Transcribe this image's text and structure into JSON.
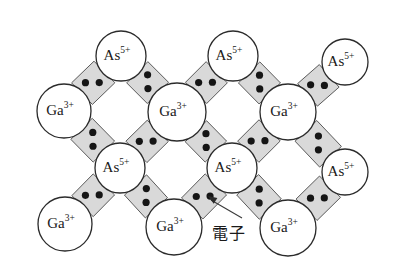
{
  "figure": {
    "background_color": "#ffffff",
    "width": 394,
    "height": 271
  },
  "legend": {
    "electron_label": "電子",
    "electron_label_meaning": "electron",
    "callout_text_x": 212,
    "callout_text_y": 220,
    "arrow_from": [
      242,
      218
    ],
    "arrow_to": [
      208,
      196
    ]
  },
  "species": {
    "gallium": {
      "base": "Ga",
      "superscript": "3+",
      "radius": 27,
      "fill": "#ffffff",
      "stroke": "#2b2b2b"
    },
    "arsenic": {
      "base": "As",
      "superscript": "5+",
      "radius": 24,
      "fill": "#ffffff",
      "stroke": "#2b2b2b"
    }
  },
  "colors": {
    "bond_fill": "#d9d9d9",
    "bond_stroke": "#4a4a4a",
    "electron_dot": "#151515",
    "atom_stroke": "#2b2b2b",
    "text": "#1a1a1a"
  },
  "atoms": [
    {
      "id": "as-r1-c1",
      "type": "arsenic",
      "label_base": "As",
      "label_sup": "5+",
      "cx": 121,
      "cy": 56,
      "r": 25
    },
    {
      "id": "as-r1-c2",
      "type": "arsenic",
      "label_base": "As",
      "label_sup": "5+",
      "cx": 233,
      "cy": 56,
      "r": 25
    },
    {
      "id": "as-r1-c3",
      "type": "arsenic",
      "label_base": "As",
      "label_sup": "5+",
      "cx": 345,
      "cy": 62,
      "r": 23
    },
    {
      "id": "ga-r2-c0",
      "type": "gallium",
      "label_base": "Ga",
      "label_sup": "3+",
      "cx": 64,
      "cy": 111,
      "r": 27
    },
    {
      "id": "ga-r2-c1",
      "type": "gallium",
      "label_base": "Ga",
      "label_sup": "3+",
      "cx": 177,
      "cy": 112,
      "r": 29
    },
    {
      "id": "ga-r2-c2",
      "type": "gallium",
      "label_base": "Ga",
      "label_sup": "3+",
      "cx": 288,
      "cy": 112,
      "r": 28
    },
    {
      "id": "as-r3-c1",
      "type": "arsenic",
      "label_base": "As",
      "label_sup": "5+",
      "cx": 120,
      "cy": 168,
      "r": 25
    },
    {
      "id": "as-r3-c2",
      "type": "arsenic",
      "label_base": "As",
      "label_sup": "5+",
      "cx": 232,
      "cy": 168,
      "r": 25
    },
    {
      "id": "as-r3-c3",
      "type": "arsenic",
      "label_base": "As",
      "label_sup": "5+",
      "cx": 345,
      "cy": 172,
      "r": 23
    },
    {
      "id": "ga-r4-c0",
      "type": "gallium",
      "label_base": "Ga",
      "label_sup": "3+",
      "cx": 65,
      "cy": 224,
      "r": 27
    },
    {
      "id": "ga-r4-c1",
      "type": "gallium",
      "label_base": "Ga",
      "label_sup": "3+",
      "cx": 174,
      "cy": 227,
      "r": 28
    },
    {
      "id": "ga-r4-c2",
      "type": "gallium",
      "label_base": "Ga",
      "label_sup": "3+",
      "cx": 288,
      "cy": 228,
      "r": 28
    }
  ],
  "bonds": [
    {
      "id": "bond-1",
      "from": "ga-r2-c0",
      "to": "as-r1-c1",
      "electrons": 2
    },
    {
      "id": "bond-2",
      "from": "as-r1-c1",
      "to": "ga-r2-c1",
      "electrons": 2
    },
    {
      "id": "bond-3",
      "from": "ga-r2-c1",
      "to": "as-r1-c2",
      "electrons": 2
    },
    {
      "id": "bond-4",
      "from": "as-r1-c2",
      "to": "ga-r2-c2",
      "electrons": 2
    },
    {
      "id": "bond-5",
      "from": "ga-r2-c2",
      "to": "as-r1-c3",
      "electrons": 2
    },
    {
      "id": "bond-6",
      "from": "ga-r2-c0",
      "to": "as-r3-c1",
      "electrons": 2
    },
    {
      "id": "bond-7",
      "from": "as-r3-c1",
      "to": "ga-r2-c1",
      "electrons": 2
    },
    {
      "id": "bond-8",
      "from": "ga-r2-c1",
      "to": "as-r3-c2",
      "electrons": 2
    },
    {
      "id": "bond-9",
      "from": "as-r3-c2",
      "to": "ga-r2-c2",
      "electrons": 2
    },
    {
      "id": "bond-10",
      "from": "ga-r2-c2",
      "to": "as-r3-c3",
      "electrons": 2
    },
    {
      "id": "bond-11",
      "from": "ga-r4-c0",
      "to": "as-r3-c1",
      "electrons": 2
    },
    {
      "id": "bond-12",
      "from": "as-r3-c1",
      "to": "ga-r4-c1",
      "electrons": 2
    },
    {
      "id": "bond-13",
      "from": "ga-r4-c1",
      "to": "as-r3-c2",
      "electrons": 2
    },
    {
      "id": "bond-14",
      "from": "as-r3-c2",
      "to": "ga-r4-c2",
      "electrons": 2
    },
    {
      "id": "bond-15",
      "from": "ga-r4-c2",
      "to": "as-r3-c3",
      "electrons": 2
    }
  ]
}
